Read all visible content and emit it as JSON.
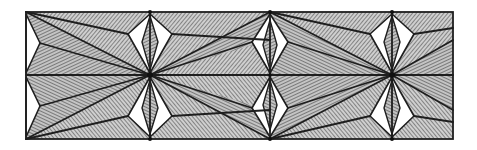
{
  "figure": {
    "colors": {
      "background": "#ffffff",
      "line": "#1e1e1e",
      "hatch": "#3c3c3c",
      "hatch_fill": "#bdbdbd"
    },
    "frame": {
      "x1": 26,
      "y1": 12,
      "x2": 453,
      "y2": 139,
      "mid_y": 75
    },
    "star_nodes": [
      {
        "x": 150,
        "y": 75
      },
      {
        "x": 392,
        "y": 75
      }
    ],
    "column_axes": [
      26,
      150,
      270,
      392
    ]
  }
}
